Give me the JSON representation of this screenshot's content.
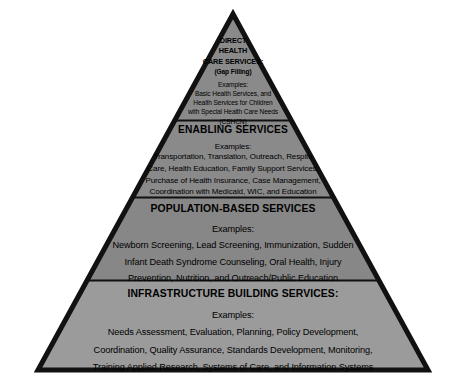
{
  "figure": {
    "name": "maternal-child-health-services-pyramid",
    "shape": "pyramid",
    "tier_count": 4,
    "background_color": "#ffffff",
    "outline_color": "#111111",
    "tiers": [
      {
        "id": "direct-health-care-services",
        "position": "apex",
        "fill_color": "#8a8a8a",
        "heading_lines": [
          "DIRECT",
          "HEALTH",
          "CARE SERVICES:"
        ],
        "subheading": "(Gap Filling)",
        "examples_label": "Examples:",
        "body_lines": [
          "Basic Health Services, and",
          "Health Services for Children",
          "with Special Health Care Needs",
          "(CSHCN)"
        ]
      },
      {
        "id": "enabling-services",
        "position": "second",
        "fill_color": "#8a8a8a",
        "heading_lines": [
          "ENABLING SERVICES"
        ],
        "examples_label": "Examples:",
        "body_lines": [
          "Transportation, Translation, Outreach, Respite",
          "Care, Health Education, Family Support Services,",
          "Purchase of Health Insurance, Case Management,",
          "Coordination with Medicaid, WIC, and Education"
        ]
      },
      {
        "id": "population-based-services",
        "position": "third",
        "fill_color": "#878787",
        "heading_lines": [
          "POPULATION-BASED SERVICES"
        ],
        "examples_label": "Examples:",
        "body_lines": [
          "Newborn Screening, Lead Screening, Immunization, Sudden",
          "Infant Death Syndrome Counseling, Oral Health, Injury",
          "Prevention, Nutrition, and Outreach/Public Education"
        ]
      },
      {
        "id": "infrastructure-building-services",
        "position": "base",
        "fill_color": "#9b9b9b",
        "heading_lines": [
          "INFRASTRUCTURE BUILDING SERVICES:"
        ],
        "examples_label": "Examples:",
        "body_lines": [
          "Needs Assessment, Evaluation, Planning, Policy Development,",
          "Coordination, Quality Assurance, Standards Development, Monitoring,",
          "Training Applied Research, Systems of Care, and Information Systems"
        ]
      }
    ]
  }
}
